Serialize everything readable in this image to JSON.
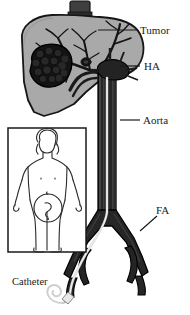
{
  "figure": {
    "type": "medical-diagram",
    "background_color": "#ffffff"
  },
  "labels": {
    "tumor": "Tumor",
    "hepatic_artery": "HA",
    "aorta": "Aorta",
    "femoral_artery": "FA",
    "catheter": "Catheter"
  },
  "anatomy": {
    "liver": {
      "name": "liver",
      "fill": "#a9a9a9",
      "stroke": "#1a1a1a"
    },
    "tumor_mass": {
      "name": "tumor-mass",
      "fill": "#141414",
      "stroke": "#000000"
    },
    "arterial_tree": {
      "name": "hepatic-arterial-tree",
      "stroke": "#141414"
    },
    "aorta_vessel": {
      "name": "aorta",
      "fill": "#262626",
      "stroke": "#000000"
    },
    "catheter_line": {
      "name": "catheter",
      "stroke": "#d6d6d6"
    },
    "vena_cava_stub": {
      "name": "vena-cava-stub",
      "fill": "#3d3d3d"
    }
  },
  "inset": {
    "name": "patient-inset",
    "border_color": "#1a1a1a",
    "figure_stroke": "#2a2a2a",
    "access_site_marker": "circle-at-groin"
  },
  "leader_lines": {
    "color": "#1a1a1a"
  }
}
